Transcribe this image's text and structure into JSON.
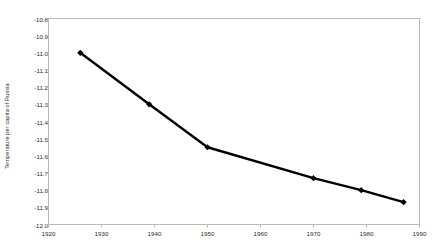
{
  "chart_data": {
    "type": "line",
    "title": "",
    "subtitle": "",
    "xlabel": "",
    "ylabel": "Temperature per capita of Russia",
    "x": [
      1926,
      1939,
      1950,
      1970,
      1979,
      1987
    ],
    "values": [
      -11.0,
      -11.3,
      -11.55,
      -11.73,
      -11.8,
      -11.87
    ],
    "series": [
      {
        "name": "Temperature per capita of Russia",
        "x": [
          1926,
          1939,
          1950,
          1970,
          1979,
          1987
        ],
        "values": [
          -11.0,
          -11.3,
          -11.55,
          -11.73,
          -11.8,
          -11.87
        ]
      }
    ],
    "xlim": [
      1920,
      1990
    ],
    "ylim": [
      -12.0,
      -10.8
    ],
    "xticks": [
      1920,
      1930,
      1940,
      1950,
      1960,
      1970,
      1980,
      1990
    ],
    "yticks": [
      -10.8,
      -10.9,
      -11.0,
      -11.1,
      -11.2,
      -11.3,
      -11.4,
      -11.5,
      -11.6,
      -11.7,
      -11.8,
      -11.9,
      -12.0
    ],
    "xtick_labels": [
      "1920",
      "1930",
      "1940",
      "1950",
      "1960",
      "1970",
      "1980",
      "1990"
    ],
    "ytick_labels": [
      "-10.8",
      "-10.9",
      "-11.0",
      "-11.1",
      "-11.2",
      "-11.3",
      "-11.4",
      "-11.5",
      "-11.6",
      "-11.7",
      "-11.8",
      "-11.9",
      "-12.0"
    ],
    "grid": false,
    "legend": false,
    "legend_position": "none",
    "marker": "diamond",
    "line_color": "#000000",
    "marker_color": "#000000",
    "plot_border_color": "#b9b9b9",
    "background_color": "#ffffff",
    "axis_text_color": "#2b2b2b"
  }
}
